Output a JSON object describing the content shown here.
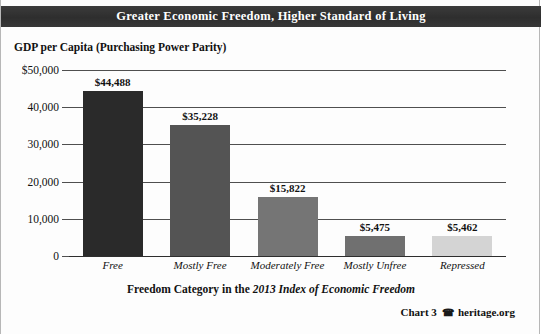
{
  "header": {
    "title": "Greater Economic Freedom, Higher Standard of Living"
  },
  "axis": {
    "y_title": "GDP per Capita (Purchasing Power Parity)",
    "x_title_plain": "Freedom Category in the ",
    "x_title_italic": "2013 Index of Economic Freedom"
  },
  "footer": {
    "chart_number": "Chart 3",
    "mark_icon": "telephone-icon",
    "mark_glyph": "☎",
    "source": "heritage.org"
  },
  "colors": {
    "title_bar": "#333333",
    "title_text": "#ffffff",
    "gridline": "#4f4f4f",
    "bar_free": "#2a2a2a",
    "bar_mostly_free": "#545454",
    "bar_moderately_free": "#757575",
    "bar_mostly_unfree": "#707070",
    "bar_repressed": "#d4d4d4"
  },
  "chart_data": {
    "type": "bar",
    "title": "Greater Economic Freedom, Higher Standard of Living",
    "subtitle": "GDP per Capita (Purchasing Power Parity)",
    "xlabel": "Freedom Category in the 2013 Index of Economic Freedom",
    "ylabel": "GDP per Capita (Purchasing Power Parity)",
    "ylim": [
      0,
      50000
    ],
    "grid": true,
    "legend": "none",
    "ytick_labels": [
      "$50,000",
      "40,000",
      "30,000",
      "20,000",
      "10,000",
      "0"
    ],
    "ytick_values": [
      50000,
      40000,
      30000,
      20000,
      10000,
      0
    ],
    "categories": [
      "Free",
      "Mostly Free",
      "Moderately Free",
      "Mostly Unfree",
      "Repressed"
    ],
    "values": [
      44488,
      35228,
      15822,
      5475,
      5462
    ],
    "value_labels": [
      "$44,488",
      "$35,228",
      "$15,822",
      "$5,475",
      "$5,462"
    ],
    "bar_colors": [
      "#2a2a2a",
      "#545454",
      "#757575",
      "#707070",
      "#d4d4d4"
    ]
  }
}
